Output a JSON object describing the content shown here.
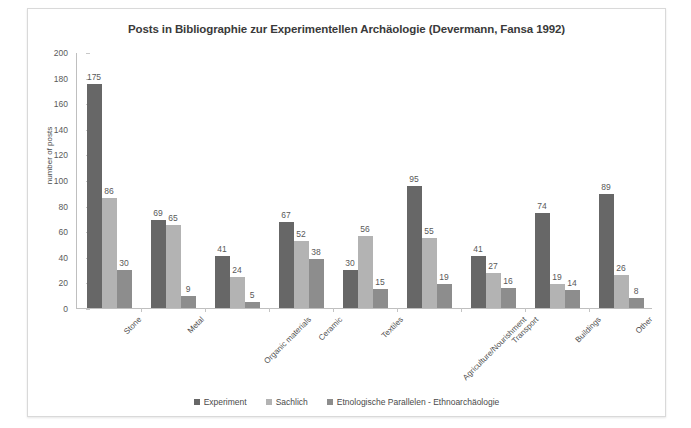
{
  "chart_data": {
    "type": "bar",
    "title": "Posts in Bibliographie zur Experimentellen Archäologie (Devermann, Fansa 1992)",
    "xlabel": "",
    "ylabel": "number of posts",
    "ylim": [
      0,
      200
    ],
    "ytick_step": 20,
    "yticks": [
      0,
      20,
      40,
      60,
      80,
      100,
      120,
      140,
      160,
      180,
      200
    ],
    "grid": false,
    "legend_position": "bottom",
    "categories": [
      "Stone",
      "Metal",
      "Organic materials",
      "Ceramic",
      "Textiles",
      "Agriculture/Nourishment",
      "Transport",
      "Buildings",
      "Other"
    ],
    "series": [
      {
        "name": "Experiment",
        "color": "#676767",
        "values": [
          175,
          69,
          41,
          67,
          30,
          95,
          41,
          74,
          89
        ]
      },
      {
        "name": "Sachlich",
        "color": "#b3b3b3",
        "values": [
          86,
          65,
          24,
          52,
          56,
          55,
          27,
          19,
          26
        ]
      },
      {
        "name": "Etnologische Parallelen - Ethnoarchäologie",
        "color": "#8d8d8d",
        "values": [
          30,
          9,
          5,
          38,
          15,
          19,
          16,
          14,
          8
        ]
      }
    ]
  },
  "legend": {
    "items": [
      {
        "label": "Experiment",
        "color": "#676767"
      },
      {
        "label": "Sachlich",
        "color": "#b3b3b3"
      },
      {
        "label": "Etnologische Parallelen - Ethnoarchäologie",
        "color": "#8d8d8d"
      }
    ]
  }
}
